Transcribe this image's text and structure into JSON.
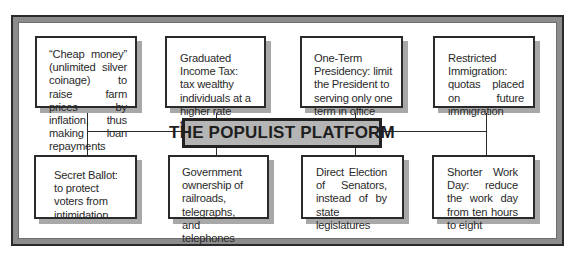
{
  "diagram": {
    "title": "THE POPULIST PLATFORM",
    "colors": {
      "frame_dark": "#2a2a2a",
      "frame_band": "#8c8c8c",
      "title_fill": "#b5b5b5",
      "box_shadow": "#a8a8a8",
      "text": "#2a2a2a"
    },
    "top_row": [
      {
        "id": "cheap-money",
        "text": "“Cheap money” (unlimited silver coinage) to raise farm prices by inflation, thus making loan repayments easier"
      },
      {
        "id": "graduated-income-tax",
        "text": "Graduated Income Tax: tax wealthy individuals at a higher rate than others"
      },
      {
        "id": "one-term-presidency",
        "text": "One-Term Presidency: limit the President to serving only one term in office"
      },
      {
        "id": "restricted-immigration",
        "text": "Restricted Immigration: quotas placed on future immigration"
      }
    ],
    "bottom_row": [
      {
        "id": "secret-ballot",
        "text": "Secret Ballot: to protect voters from intimidation"
      },
      {
        "id": "government-ownership",
        "text": "Government ownership of railroads, telegraphs, and telephones"
      },
      {
        "id": "direct-election-senators",
        "text": "Direct Election of Senators, instead of by state legislatures"
      },
      {
        "id": "shorter-work-day",
        "text": "Shorter Work Day: reduce the work day from ten hours to eight"
      }
    ]
  }
}
